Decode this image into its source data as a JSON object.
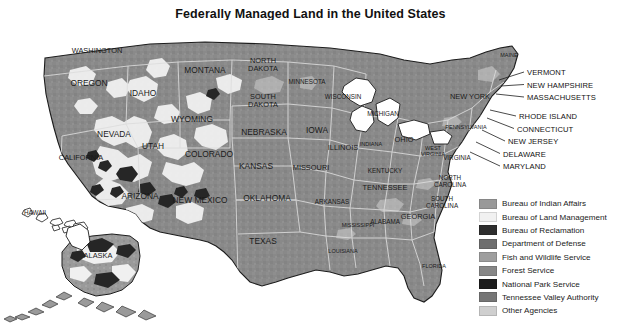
{
  "title": "Federally Managed Land in the United States",
  "map": {
    "base_land_color": "#8a8a8a",
    "ocean_color": "#ffffff",
    "border_color": "#d8d8d8",
    "outline_color": "#1d1d1d",
    "federal_land_light_color": "#f2f2f2",
    "federal_land_dark_color": "#2b2b2b",
    "state_labels": [
      {
        "name": "WASHINGTON",
        "x": 97,
        "y": 51,
        "size": "sz8"
      },
      {
        "name": "OREGON",
        "x": 89,
        "y": 83,
        "size": "sz9"
      },
      {
        "name": "IDAHO",
        "x": 143,
        "y": 93,
        "size": "sz9"
      },
      {
        "name": "MONTANA",
        "x": 205,
        "y": 70,
        "size": "sz9"
      },
      {
        "name": "NORTH DAKOTA",
        "x": 263,
        "y": 65,
        "size": "sz8"
      },
      {
        "name": "SOUTH DAKOTA",
        "x": 263,
        "y": 101,
        "size": "sz8"
      },
      {
        "name": "MINNESOTA",
        "x": 307,
        "y": 82,
        "size": "sz7"
      },
      {
        "name": "WISCONSIN",
        "x": 343,
        "y": 97,
        "size": "sz7"
      },
      {
        "name": "MICHIGAN",
        "x": 383,
        "y": 114,
        "size": "sz7"
      },
      {
        "name": "MAINE",
        "x": 509,
        "y": 56,
        "size": "sz6"
      },
      {
        "name": "NEW YORK",
        "x": 470,
        "y": 97,
        "size": "sz8"
      },
      {
        "name": "PENNSYLVANIA",
        "x": 466,
        "y": 128,
        "size": "sz6"
      },
      {
        "name": "WYOMING",
        "x": 192,
        "y": 119,
        "size": "sz9"
      },
      {
        "name": "NEVADA",
        "x": 114,
        "y": 134,
        "size": "sz9"
      },
      {
        "name": "UTAH",
        "x": 153,
        "y": 146,
        "size": "sz9"
      },
      {
        "name": "COLORADO",
        "x": 209,
        "y": 154,
        "size": "sz9"
      },
      {
        "name": "NEBRASKA",
        "x": 264,
        "y": 132,
        "size": "sz9"
      },
      {
        "name": "IOWA",
        "x": 317,
        "y": 130,
        "size": "sz9"
      },
      {
        "name": "ILLINOIS",
        "x": 343,
        "y": 148,
        "size": "sz8"
      },
      {
        "name": "INDIANA",
        "x": 371,
        "y": 145,
        "size": "sz6"
      },
      {
        "name": "OHIO",
        "x": 404,
        "y": 140,
        "size": "sz8"
      },
      {
        "name": "WEST VIRGINIA",
        "x": 433,
        "y": 152,
        "size": "sz6"
      },
      {
        "name": "VIRGINIA",
        "x": 457,
        "y": 158,
        "size": "sz7"
      },
      {
        "name": "CALIFORNIA",
        "x": 81,
        "y": 158,
        "size": "sz8"
      },
      {
        "name": "KANSAS",
        "x": 256,
        "y": 166,
        "size": "sz9"
      },
      {
        "name": "MISSOURI",
        "x": 311,
        "y": 168,
        "size": "sz8"
      },
      {
        "name": "KENTUCKY",
        "x": 385,
        "y": 171,
        "size": "sz7"
      },
      {
        "name": "ARIZONA",
        "x": 140,
        "y": 196,
        "size": "sz9"
      },
      {
        "name": "NEW MEXICO",
        "x": 200,
        "y": 200,
        "size": "sz9"
      },
      {
        "name": "OKLAHOMA",
        "x": 267,
        "y": 198,
        "size": "sz9"
      },
      {
        "name": "ARKANSAS",
        "x": 332,
        "y": 202,
        "size": "sz7"
      },
      {
        "name": "TENNESSEE",
        "x": 385,
        "y": 188,
        "size": "sz8"
      },
      {
        "name": "NORTH CAROLINA",
        "x": 450,
        "y": 182,
        "size": "sz7"
      },
      {
        "name": "SOUTH CAROLINA",
        "x": 442,
        "y": 203,
        "size": "sz7"
      },
      {
        "name": "MISSISSIPPI",
        "x": 358,
        "y": 226,
        "size": "sz6"
      },
      {
        "name": "ALABAMA",
        "x": 385,
        "y": 222,
        "size": "sz7"
      },
      {
        "name": "GEORGIA",
        "x": 418,
        "y": 217,
        "size": "sz8"
      },
      {
        "name": "TEXAS",
        "x": 263,
        "y": 241,
        "size": "sz9"
      },
      {
        "name": "LOUISIANA",
        "x": 343,
        "y": 252,
        "size": "sz6"
      },
      {
        "name": "FLORIDA",
        "x": 434,
        "y": 267,
        "size": "sz6"
      },
      {
        "name": "HAWAII",
        "x": 35,
        "y": 213,
        "size": "sz7"
      },
      {
        "name": "ALASKA",
        "x": 98,
        "y": 256,
        "size": "sz8"
      }
    ],
    "callout_labels": [
      {
        "name": "VERMONT",
        "x": 527,
        "y": 72
      },
      {
        "name": "NEW HAMPSHIRE",
        "x": 527,
        "y": 84.5
      },
      {
        "name": "MASSACHUSETTS",
        "x": 527,
        "y": 97
      },
      {
        "name": "RHODE ISLAND",
        "x": 519,
        "y": 116
      },
      {
        "name": "CONNECTICUT",
        "x": 517,
        "y": 128.5
      },
      {
        "name": "NEW JERSEY",
        "x": 508,
        "y": 141
      },
      {
        "name": "DELAWARE",
        "x": 503,
        "y": 153.5
      },
      {
        "name": "MARYLAND",
        "x": 503,
        "y": 166
      }
    ]
  },
  "legend": {
    "items": [
      {
        "label": "Bureau of Indian Affairs",
        "color": "#999999"
      },
      {
        "label": "Bureau of Land Management",
        "color": "#f1f1f1"
      },
      {
        "label": "Bureau of Reclamation",
        "color": "#2e2e2e"
      },
      {
        "label": "Department of Defense",
        "color": "#6e6e6e"
      },
      {
        "label": "Fish and Wildlife Service",
        "color": "#9e9e9e"
      },
      {
        "label": "Forest Service",
        "color": "#878787"
      },
      {
        "label": "National Park Service",
        "color": "#1c1c1c"
      },
      {
        "label": "Tennessee Valley Authority",
        "color": "#767676"
      },
      {
        "label": "Other Agencies",
        "color": "#cfcfcf"
      }
    ]
  }
}
